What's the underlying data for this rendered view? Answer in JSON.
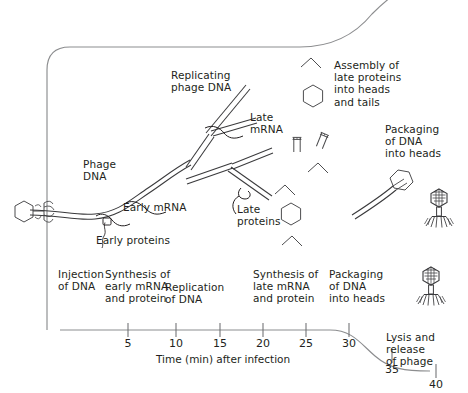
{
  "figure": {
    "background_color": "#ffffff",
    "ink_color": "#231f20",
    "line_color": "#6d6e71"
  },
  "cell": {
    "name": "host bacterial cell outline"
  },
  "annotations": {
    "phage_dna": "Phage\nDNA",
    "early_mrna": "Early mRNA",
    "early_proteins": "Early proteins",
    "replicating_phage_dna": "Replicating\nphage DNA",
    "late_mrna": "Late\nmRNA",
    "late_proteins": "Late\nproteins",
    "assembly": "Assembly of\nlate proteins\ninto heads\nand tails",
    "packaging_upper": "Packaging\nof DNA\ninto heads"
  },
  "stages": [
    {
      "label": "Injection\nof DNA"
    },
    {
      "label": "Synthesis of\nearly mRNA\nand protein"
    },
    {
      "label": "Replication\nof DNA"
    },
    {
      "label": "Synthesis of\nlate mRNA\nand protein"
    },
    {
      "label": "Packaging\nof DNA\ninto heads"
    },
    {
      "label": "Lysis and\nrelease\nof phage"
    }
  ],
  "axis": {
    "title": "Time (min) after infection",
    "unit": "min",
    "ticks": [
      {
        "value": "5"
      },
      {
        "value": "10"
      },
      {
        "value": "15"
      },
      {
        "value": "20"
      },
      {
        "value": "25"
      },
      {
        "value": "30"
      },
      {
        "value": "35"
      },
      {
        "value": "40"
      }
    ]
  },
  "icons": {
    "phage_particle": "bacteriophage-icon",
    "phage_head": "hexagon-head-icon",
    "tail_fiber": "chevron-tail-fiber-icon",
    "tail_tube": "tail-tube-icon",
    "ribosome": "ribosome-icon"
  }
}
